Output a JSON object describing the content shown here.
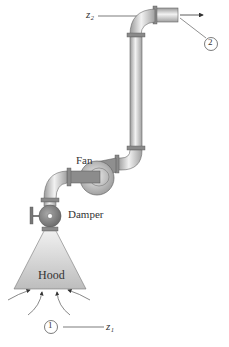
{
  "diagram": {
    "labels": {
      "fan": "Fan",
      "damper": "Damper",
      "hood": "Hood",
      "z2": "z₂",
      "z1": "z₁",
      "point1": "1",
      "point2": "2"
    },
    "colors": {
      "pipe_fill": "#d9d9d9",
      "pipe_dark": "#8a8a8a",
      "hood_fill": "#c8c8c8",
      "line": "#444444"
    }
  }
}
